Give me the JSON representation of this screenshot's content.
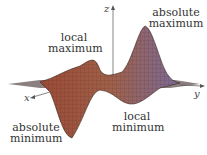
{
  "figure": {
    "type": "3d-surface",
    "axes": {
      "x": "x",
      "y": "y",
      "z": "z"
    },
    "labels": {
      "abs_max": [
        "absolute",
        "maximum"
      ],
      "local_max": [
        "local",
        "maximum"
      ],
      "local_min": [
        "local",
        "minimum"
      ],
      "abs_min": [
        "absolute",
        "minimum"
      ]
    },
    "colors": {
      "surface_warm": "#a0503a",
      "surface_cool": "#7a6a9a",
      "mesh": "#3a2620"
    }
  }
}
